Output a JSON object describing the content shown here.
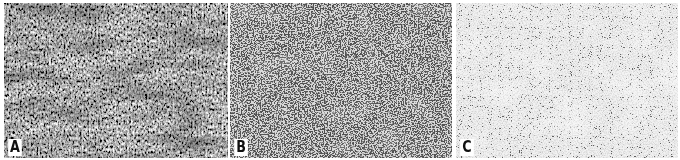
{
  "figure": {
    "panels": [
      {
        "label": "A",
        "description": "Dense fibrillary/fascicular tissue, dark gray overall with streaming texture",
        "base_color": "#8a8a8a",
        "dot_color": "#2a2a2a",
        "density": "high"
      },
      {
        "label": "B",
        "description": "Highly cellular tissue with densely packed dark nuclei on light background",
        "base_color": "#d6d6d6",
        "dot_color": "#1e1e1e",
        "density": "high"
      },
      {
        "label": "C",
        "description": "Pale tissue with sparse scattered dark nuclei",
        "base_color": "#eeeeee",
        "dot_color": "#333333",
        "density": "low"
      }
    ]
  }
}
